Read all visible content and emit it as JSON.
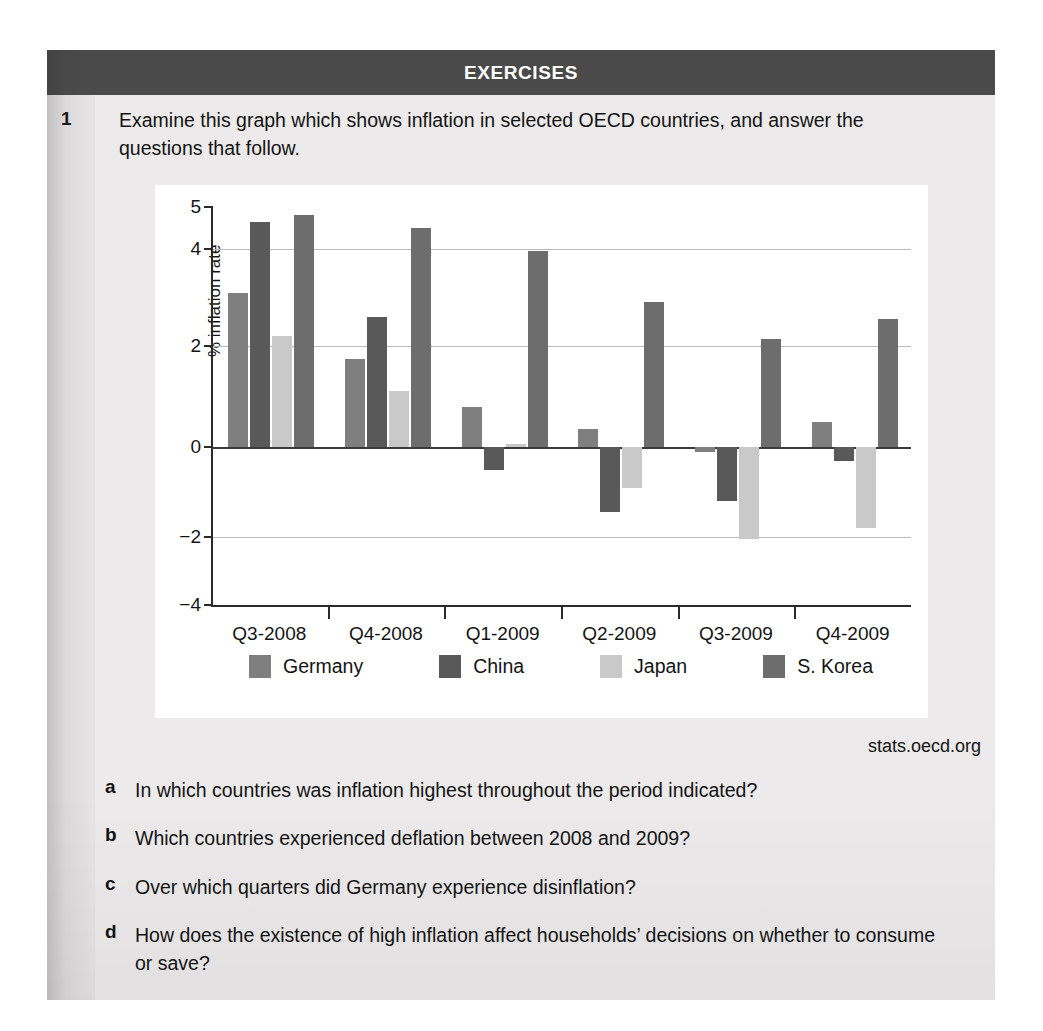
{
  "header": {
    "title": "EXERCISES"
  },
  "question": {
    "number": "1",
    "stem": "Examine this graph which shows inflation in selected OECD countries,  and answer the questions that follow.",
    "source": "stats.oecd.org",
    "parts": [
      {
        "letter": "a",
        "text": "In which countries was inflation highest throughout the period indicated?"
      },
      {
        "letter": "b",
        "text": "Which countries experienced deflation between 2008 and 2009?"
      },
      {
        "letter": "c",
        "text": "Over which quarters did Germany experience disinflation?"
      },
      {
        "letter": "d",
        "text": "How does the existence of high inflation affect households’ decisions on whether to consume or save?"
      }
    ]
  },
  "chart_data": {
    "type": "bar",
    "title": "",
    "xlabel": "",
    "ylabel": "% inflation rate",
    "ylim": [
      -4,
      5
    ],
    "yticks": [
      5,
      4,
      2,
      0,
      -2,
      -4
    ],
    "ytick_labels": [
      "5",
      "4",
      "2",
      "0",
      "−2",
      "−4"
    ],
    "gridlines": [
      4,
      2,
      0,
      -2
    ],
    "grid": true,
    "legend_position": "bottom",
    "categories": [
      "Q3-2008",
      "Q4-2008",
      "Q1-2009",
      "Q2-2009",
      "Q3-2009",
      "Q4-2009"
    ],
    "series": [
      {
        "name": "Germany",
        "color": "#7f7f7f",
        "values": [
          3.1,
          1.75,
          0.8,
          0.35,
          -0.1,
          0.5
        ]
      },
      {
        "name": "China",
        "color": "#595959",
        "values": [
          4.65,
          2.6,
          -0.5,
          -1.45,
          -1.2,
          -0.3
        ]
      },
      {
        "name": "Japan",
        "color": "#c9c9c9",
        "values": [
          2.2,
          1.1,
          0.05,
          -0.9,
          -2.05,
          -1.8
        ]
      },
      {
        "name": "S. Korea",
        "color": "#6d6d6d",
        "values": [
          4.8,
          4.5,
          3.95,
          2.9,
          2.15,
          2.55
        ]
      }
    ]
  }
}
